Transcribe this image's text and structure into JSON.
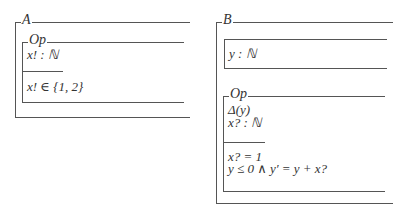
{
  "schemas": {
    "A": {
      "name": "A",
      "op": {
        "name": "Op",
        "declarations": [
          "x! : ℕ"
        ],
        "predicates": [
          "x! ∈ {1, 2}"
        ]
      }
    },
    "B": {
      "name": "B",
      "state": {
        "declarations": [
          "y : ℕ"
        ]
      },
      "op": {
        "name": "Op",
        "declarations": [
          "Δ(y)",
          "x? : ℕ"
        ],
        "predicates": [
          "x? = 1",
          "y ≤ 0 ∧ y′ = y + x?"
        ]
      }
    }
  }
}
